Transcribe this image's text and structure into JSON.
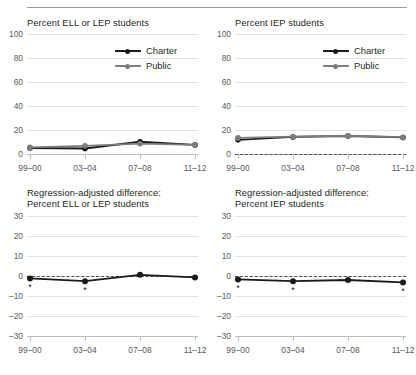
{
  "chart_data": [
    {
      "id": "percent-ell-lep",
      "type": "line",
      "title": "Percent ELL or LEP students",
      "xlabel": "",
      "ylabel": "",
      "categories": [
        "99–00",
        "03–04",
        "07–08",
        "11–12"
      ],
      "yticks": [
        0,
        20,
        40,
        60,
        80,
        100
      ],
      "ylim": [
        0,
        100
      ],
      "grid": true,
      "zero_line": false,
      "legend_position": "top-right",
      "series": [
        {
          "name": "Charter",
          "color": "#1a1a1a",
          "values": [
            5.0,
            4.6,
            10.2,
            7.6
          ]
        },
        {
          "name": "Public",
          "color": "#7d7d7d",
          "values": [
            5.6,
            6.8,
            8.6,
            7.6
          ]
        }
      ]
    },
    {
      "id": "percent-iep",
      "type": "line",
      "title": "Percent IEP students",
      "xlabel": "",
      "ylabel": "",
      "categories": [
        "99–00",
        "03–04",
        "07–08",
        "11–12"
      ],
      "yticks": [
        0,
        20,
        40,
        60,
        80,
        100
      ],
      "ylim": [
        0,
        100
      ],
      "grid": true,
      "zero_line": true,
      "legend_position": "top-right",
      "series": [
        {
          "name": "Charter",
          "color": "#1a1a1a",
          "values": [
            11.8,
            14.2,
            15.0,
            13.8
          ]
        },
        {
          "name": "Public",
          "color": "#7d7d7d",
          "values": [
            13.4,
            14.4,
            15.2,
            14.0
          ]
        }
      ]
    },
    {
      "id": "regadj-ell-lep",
      "type": "line",
      "title": "Regression-adjusted difference:\nPercent ELL or LEP students",
      "xlabel": "",
      "ylabel": "",
      "categories": [
        "99–00",
        "03–04",
        "07–08",
        "11–12"
      ],
      "yticks": [
        -30,
        -20,
        -10,
        0,
        10,
        20,
        30
      ],
      "ylim": [
        -30,
        30
      ],
      "grid": true,
      "zero_line": true,
      "legend_position": "none",
      "series": [
        {
          "name": "Charter",
          "color": "#1a1a1a",
          "values": [
            -1.2,
            -2.6,
            0.6,
            -0.7
          ]
        }
      ],
      "significance_markers": [
        "*",
        "*",
        "",
        ""
      ],
      "significance_symbol": "*"
    },
    {
      "id": "regadj-iep",
      "type": "line",
      "title": "Regression-adjusted difference:\nPercent IEP students",
      "xlabel": "",
      "ylabel": "",
      "categories": [
        "99–00",
        "03–04",
        "07–08",
        "11–12"
      ],
      "yticks": [
        -30,
        -20,
        -10,
        0,
        10,
        20,
        30
      ],
      "ylim": [
        -30,
        30
      ],
      "grid": true,
      "zero_line": true,
      "legend_position": "none",
      "series": [
        {
          "name": "Charter",
          "color": "#1a1a1a",
          "values": [
            -1.7,
            -2.6,
            -2.0,
            -3.2
          ]
        }
      ],
      "significance_markers": [
        "*",
        "*",
        "",
        "*"
      ],
      "significance_symbol": "*"
    }
  ],
  "legend": {
    "charter_label": "Charter",
    "public_label": "Public",
    "charter_color": "#1a1a1a",
    "public_color": "#7d7d7d"
  },
  "panels": {
    "tl": {
      "title": "Percent ELL or LEP students"
    },
    "tr": {
      "title": "Percent IEP students"
    },
    "bl": {
      "title_line1": "Regression-adjusted difference:",
      "title_line2": "Percent ELL or LEP students"
    },
    "br": {
      "title_line1": "Regression-adjusted difference:",
      "title_line2": "Percent IEP students"
    }
  },
  "axis": {
    "xticks": [
      "99–00",
      "03–04",
      "07–08",
      "11–12"
    ],
    "yticks_top": [
      "100",
      "80",
      "60",
      "40",
      "20",
      "0"
    ],
    "yticks_bottom": [
      "30",
      "20",
      "10",
      "0",
      "–10",
      "–20",
      "–30"
    ]
  },
  "colors": {
    "grid": "#e2e2e2",
    "baseline": "#bdbdbd",
    "text": "#231f20",
    "tick_text": "#58595b",
    "rule": "#9b9b9b"
  }
}
